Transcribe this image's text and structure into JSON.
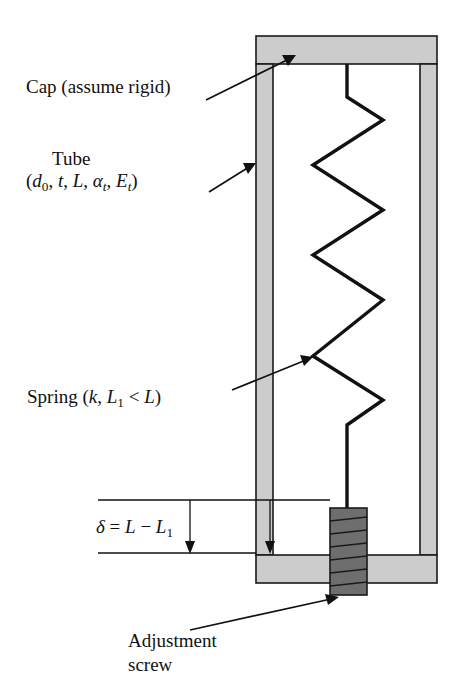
{
  "figure": {
    "labels": {
      "cap": "Cap (assume rigid)",
      "tube": "Tube",
      "tube_params_plain": "(d0, t, L, αt, Et)",
      "spring_plain": "Spring (k, L1 < L)",
      "delta_plain": "δ = L − L1",
      "screw_line1": "Adjustment",
      "screw_line2": "screw"
    },
    "symbols": {
      "outer_diameter": "d",
      "outer_diameter_sub": "0",
      "wall_thickness": "t",
      "tube_length": "L",
      "alpha": "α",
      "alpha_sub": "t",
      "modulus": "E",
      "modulus_sub": "t",
      "spring_constant": "k",
      "spring_length": "L",
      "spring_length_sub": "1",
      "less_than": "<",
      "delta": "δ",
      "equals": "=",
      "minus": "−",
      "open_paren": "(",
      "close_paren": ")",
      "comma": ","
    },
    "colors": {
      "background": "#ffffff",
      "outline": "#1a1a1a",
      "tube_fill": "#cccccc",
      "cap_fill": "#cccccc",
      "screw_fill": "#6e6e6e",
      "screw_thread": "#1a1a1a",
      "spring_stroke": "#111111",
      "leader_stroke": "#111111"
    },
    "geometry": {
      "canvas_width": 464,
      "canvas_height": 698,
      "top_cap": {
        "x": 256,
        "y": 36,
        "width": 181,
        "height": 28
      },
      "bottom_cap": {
        "x": 256,
        "y": 555,
        "width": 181,
        "height": 28
      },
      "left_wall": {
        "x": 256,
        "y": 64,
        "width": 17,
        "height": 491
      },
      "right_wall": {
        "x": 420,
        "y": 64,
        "width": 17,
        "height": 491
      },
      "screw": {
        "x": 330,
        "y": 508,
        "width": 37,
        "height": 87,
        "threads": 9
      },
      "spring": {
        "anchor_top_x": 347,
        "anchor_top_y": 64,
        "left_x": 313,
        "right_x": 383,
        "anchor_bottom_x": 347,
        "anchor_bottom_y": 508,
        "coils": 5
      },
      "dimension": {
        "upper_line_y": 500,
        "lower_line_y": 553,
        "arrow_x": 190,
        "left_extent": 98,
        "right_extent": 270
      }
    }
  }
}
